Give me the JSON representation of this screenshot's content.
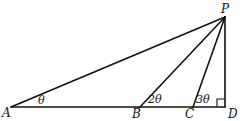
{
  "diagram": {
    "type": "geometry-triangle",
    "points": {
      "A": {
        "label": "A",
        "x": 11,
        "y": 107
      },
      "B": {
        "label": "B",
        "x": 140,
        "y": 107
      },
      "C": {
        "label": "C",
        "x": 193,
        "y": 107
      },
      "D": {
        "label": "D",
        "x": 225,
        "y": 107
      },
      "P": {
        "label": "P",
        "x": 225,
        "y": 17
      }
    },
    "segments": [
      [
        "A",
        "D"
      ],
      [
        "D",
        "P"
      ],
      [
        "A",
        "P"
      ],
      [
        "B",
        "P"
      ],
      [
        "C",
        "P"
      ]
    ],
    "angles": {
      "at_A": "θ",
      "at_B": "2θ",
      "at_C": "3θ"
    },
    "right_angle_at": "D",
    "stroke_color": "#111111",
    "background": "#ffffff"
  }
}
